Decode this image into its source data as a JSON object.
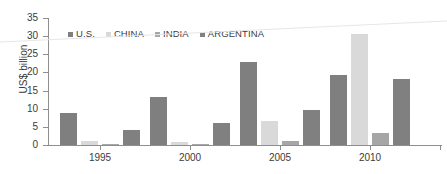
{
  "chart_data": {
    "type": "bar",
    "title": "",
    "xlabel": "",
    "ylabel": "US$ billion",
    "ylim": [
      0,
      35
    ],
    "yticks": [
      0,
      5,
      10,
      15,
      20,
      25,
      30,
      35
    ],
    "categories": [
      "1995",
      "2000",
      "2005",
      "2010"
    ],
    "grid": false,
    "legend_position": "top-left",
    "series": [
      {
        "name": "U.S.",
        "color": "#7f7f7f",
        "values": [
          8.7,
          13.2,
          22.8,
          19.3
        ]
      },
      {
        "name": "CHINA",
        "color": "#d9d9d9",
        "values": [
          1.1,
          0.8,
          6.7,
          30.5
        ]
      },
      {
        "name": "INDIA",
        "color": "#a6a6a6",
        "values": [
          0.2,
          0.1,
          1.1,
          3.4
        ]
      },
      {
        "name": "ARGENTINA",
        "color": "#808080",
        "values": [
          4.1,
          6.1,
          9.7,
          18.3
        ]
      }
    ]
  },
  "axis": {
    "y_title": "US$ billion",
    "y_tick_labels": [
      "35",
      "30",
      "25",
      "20",
      "15",
      "10",
      "5",
      "0"
    ],
    "x_tick_labels": [
      "1995",
      "2000",
      "2005",
      "2010"
    ]
  },
  "legend": {
    "items": [
      {
        "label": "U.S.",
        "color": "#7f7f7f"
      },
      {
        "label": "CHINA",
        "color": "#d9d9d9"
      },
      {
        "label": "INDIA",
        "color": "#a6a6a6"
      },
      {
        "label": "ARGENTINA",
        "color": "#808080"
      }
    ]
  },
  "colors": {
    "axis": "#8e8e8e",
    "text": "#3b3b3b",
    "background": "#ffffff",
    "artifact": "#e8e8e8"
  }
}
